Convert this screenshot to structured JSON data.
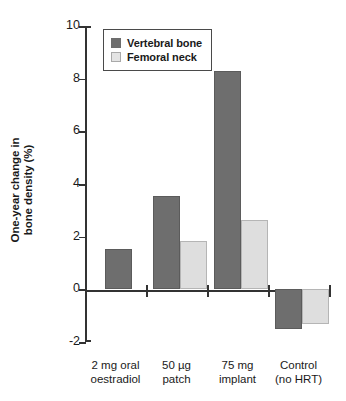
{
  "chart_data": {
    "type": "bar",
    "title": "",
    "xlabel": "",
    "ylabel": "One-year change in\nbone density (%)",
    "ylim": [
      -2,
      10
    ],
    "yticks": [
      10,
      8,
      6,
      4,
      2,
      0,
      -2
    ],
    "ytick_labels": [
      "10",
      "8",
      "6",
      "4",
      "2",
      "0",
      "-2"
    ],
    "grid": false,
    "legend_position": "top-left",
    "categories": [
      "2 mg oral\noestradiol",
      "50 µg\npatch",
      "75 mg\nimplant",
      "Control\n(no HRT)"
    ],
    "series": [
      {
        "name": "Vertebral bone",
        "color": "#6e6e6e",
        "values": [
          1.55,
          3.55,
          8.3,
          -1.5
        ]
      },
      {
        "name": "Femoral neck",
        "color": "#dedede",
        "values": [
          null,
          1.85,
          2.65,
          -1.3
        ]
      }
    ]
  },
  "legend": {
    "items": [
      {
        "label": "Vertebral bone",
        "swatch": "dark"
      },
      {
        "label": "Femoral neck",
        "swatch": "light"
      }
    ]
  },
  "colors": {
    "vertebral_bone": "#6e6e6e",
    "femoral_neck": "#dedede",
    "axis": "#333333",
    "background": "#ffffff"
  }
}
